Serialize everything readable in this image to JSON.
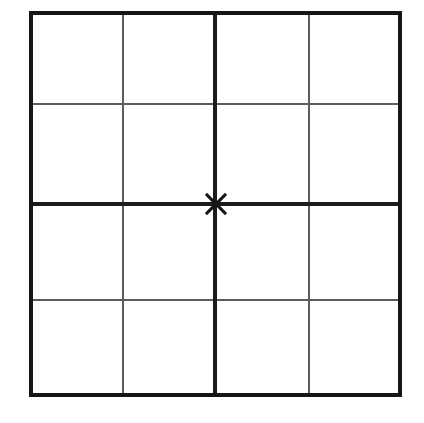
{
  "figure": {
    "title": "Four-by-four grid with center cross mark",
    "background_color": "#ffffff",
    "width": 424,
    "height": 423
  },
  "grid": {
    "rows": 4,
    "columns": 4,
    "outer_border": {
      "color": "#161616",
      "thickness": 4,
      "left": 31,
      "top": 13,
      "right": 400,
      "bottom": 395
    },
    "major_lines": {
      "color": "#1c1c1c",
      "thickness": 4,
      "vertical_x": [
        215
      ],
      "horizontal_y": [
        204
      ]
    },
    "minor_lines": {
      "color": "#5c5c5c",
      "thickness": 2,
      "vertical_x": [
        123,
        309
      ],
      "horizontal_y": [
        104,
        300
      ]
    },
    "vertical_line_positions": [
      31,
      123,
      215,
      309,
      400
    ],
    "horizontal_line_positions": [
      13,
      104,
      204,
      300,
      395
    ]
  },
  "marker": {
    "name": "center-cross-mark",
    "shape": "x-cross",
    "center_x": 216,
    "center_y": 204,
    "arm_length": 14,
    "stroke_color": "#161616",
    "stroke_width": 3
  }
}
